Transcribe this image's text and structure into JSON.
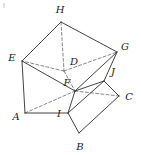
{
  "figure": {
    "stroke_color": "#3a3a3a",
    "dash_color": "#6a6a6a",
    "background": "#ffffff",
    "width": 141,
    "height": 155,
    "vertices": [
      {
        "id": "A",
        "label": "A",
        "x": 25,
        "y": 113,
        "label_x": 16,
        "label_y": 117,
        "hidden": false
      },
      {
        "id": "B",
        "label": "B",
        "x": 79,
        "y": 133,
        "label_x": 80,
        "label_y": 147,
        "hidden": false
      },
      {
        "id": "C",
        "label": "C",
        "x": 119,
        "y": 96,
        "label_x": 129,
        "label_y": 97,
        "hidden": false
      },
      {
        "id": "D",
        "label": "D",
        "x": 64,
        "y": 71,
        "label_x": 74,
        "label_y": 62,
        "hidden": true
      },
      {
        "id": "E",
        "label": "E",
        "x": 22,
        "y": 61,
        "label_x": 12,
        "label_y": 58,
        "hidden": false
      },
      {
        "id": "F",
        "label": "F",
        "x": 75,
        "y": 91,
        "label_x": 67,
        "label_y": 83,
        "hidden": false
      },
      {
        "id": "G",
        "label": "G",
        "x": 117,
        "y": 52,
        "label_x": 125,
        "label_y": 47,
        "hidden": false
      },
      {
        "id": "H",
        "label": "H",
        "x": 61,
        "y": 22,
        "label_x": 60,
        "label_y": 10,
        "hidden": false
      },
      {
        "id": "I",
        "label": "I",
        "x": 68,
        "y": 113,
        "label_x": 59,
        "label_y": 114,
        "hidden": false
      },
      {
        "id": "J",
        "label": "J",
        "x": 104,
        "y": 81,
        "label_x": 113,
        "label_y": 72,
        "hidden": false
      }
    ],
    "solid_edges": [
      {
        "from": "E",
        "to": "H",
        "name": "edge-E-H"
      },
      {
        "from": "H",
        "to": "G",
        "name": "edge-H-G"
      },
      {
        "from": "E",
        "to": "A",
        "name": "edge-E-A"
      },
      {
        "from": "A",
        "to": "I",
        "name": "edge-A-I"
      },
      {
        "from": "I",
        "to": "B",
        "name": "edge-I-B"
      },
      {
        "from": "B",
        "to": "C",
        "name": "edge-B-C"
      },
      {
        "from": "C",
        "to": "J",
        "name": "edge-C-J"
      },
      {
        "from": "J",
        "to": "G",
        "name": "edge-J-G"
      },
      {
        "from": "E",
        "to": "F",
        "name": "edge-E-F"
      },
      {
        "from": "F",
        "to": "G",
        "name": "edge-F-G"
      },
      {
        "from": "F",
        "to": "I",
        "name": "edge-F-I"
      },
      {
        "from": "F",
        "to": "J",
        "name": "edge-F-J"
      },
      {
        "from": "I",
        "to": "J",
        "name": "edge-I-J"
      }
    ],
    "dashed_edges": [
      {
        "from": "H",
        "to": "D",
        "name": "edge-H-D-hidden"
      },
      {
        "from": "D",
        "to": "E",
        "name": "edge-D-E-hidden"
      },
      {
        "from": "D",
        "to": "G",
        "name": "edge-D-G-hidden"
      },
      {
        "from": "D",
        "to": "F",
        "name": "edge-D-F-hidden"
      },
      {
        "from": "A",
        "to": "F",
        "name": "edge-A-F-hidden"
      },
      {
        "from": "F",
        "to": "C",
        "name": "edge-F-C-hidden"
      }
    ],
    "corner_artifact": true
  }
}
